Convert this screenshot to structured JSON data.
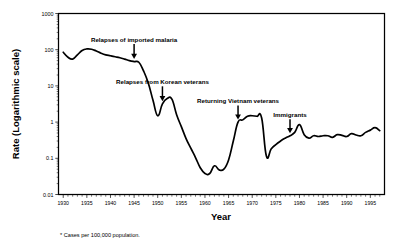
{
  "chart_data": {
    "type": "line",
    "title": "",
    "xlabel": "Year",
    "ylabel": "Rate (Logarithmic scale)",
    "footnote": "*  Cases per 100,000 population.",
    "yscale": "log",
    "ylim": [
      0.01,
      1000
    ],
    "xlim": [
      1929,
      1998
    ],
    "grid": false,
    "legend": "none",
    "ytick_labels": [
      "1000",
      "100",
      "10",
      "1",
      "0.1",
      "0.01"
    ],
    "ytick_values": [
      1000,
      100,
      10,
      1,
      0.1,
      0.01
    ],
    "xtick_labels": [
      "1930",
      "1935",
      "1940",
      "1945",
      "1950",
      "1955",
      "1960",
      "1965",
      "1970",
      "1975",
      "1980",
      "1985",
      "1990",
      "1995"
    ],
    "xtick_values": [
      1930,
      1935,
      1940,
      1945,
      1950,
      1955,
      1960,
      1965,
      1970,
      1975,
      1980,
      1985,
      1990,
      1995
    ],
    "xminor_step": 1,
    "series": [
      {
        "name": "Malaria rate per 100,000 population",
        "x": [
          1930,
          1931,
          1932,
          1933,
          1934,
          1935,
          1936,
          1937,
          1938,
          1939,
          1940,
          1941,
          1942,
          1943,
          1944,
          1945,
          1946,
          1947,
          1948,
          1949,
          1950,
          1951,
          1952,
          1953,
          1954,
          1955,
          1956,
          1957,
          1958,
          1959,
          1960,
          1961,
          1962,
          1963,
          1964,
          1965,
          1966,
          1967,
          1968,
          1969,
          1970,
          1971,
          1972,
          1973,
          1974,
          1975,
          1976,
          1977,
          1978,
          1979,
          1980,
          1981,
          1982,
          1983,
          1984,
          1985,
          1986,
          1987,
          1988,
          1989,
          1990,
          1991,
          1992,
          1993,
          1994,
          1995,
          1996,
          1997
        ],
        "y": [
          85,
          62,
          55,
          72,
          95,
          105,
          103,
          92,
          80,
          72,
          68,
          64,
          60,
          55,
          50,
          47,
          45,
          26,
          12,
          4.0,
          1.5,
          3.2,
          4.5,
          4.3,
          1.6,
          0.75,
          0.35,
          0.19,
          0.105,
          0.055,
          0.038,
          0.038,
          0.062,
          0.048,
          0.05,
          0.09,
          0.3,
          1.0,
          1.15,
          1.45,
          1.5,
          1.45,
          1.3,
          0.115,
          0.18,
          0.24,
          0.3,
          0.36,
          0.42,
          0.52,
          0.85,
          0.45,
          0.36,
          0.42,
          0.4,
          0.42,
          0.42,
          0.38,
          0.45,
          0.43,
          0.4,
          0.48,
          0.44,
          0.42,
          0.52,
          0.6,
          0.7,
          0.58
        ]
      }
    ],
    "annotations": [
      {
        "label": "Relapses of imported malaria",
        "x": 1945,
        "y": 47
      },
      {
        "label": "Relapses from Korean veterans",
        "x": 1951,
        "y": 3.2
      },
      {
        "label": "Returning Vietnam veterans",
        "x": 1967,
        "y": 1.0
      },
      {
        "label": "Immigrants",
        "x": 1978,
        "y": 0.42
      }
    ]
  }
}
